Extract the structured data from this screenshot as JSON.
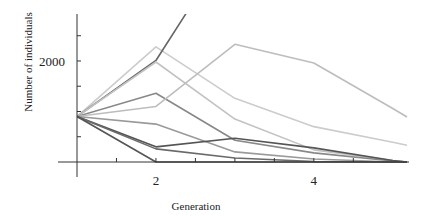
{
  "chart_data": {
    "type": "line",
    "title": "",
    "xlabel": "Generation",
    "ylabel": "Number of individuals",
    "x_ticks": [
      1.5,
      2,
      2.5,
      3,
      3.5,
      4,
      4.5
    ],
    "x_tick_labels": [
      {
        "value": 2,
        "label": "2"
      },
      {
        "value": 4,
        "label": "4"
      }
    ],
    "y_ticks": [
      500,
      1000,
      1500,
      2000,
      2500
    ],
    "y_tick_labels": [
      {
        "value": 2000,
        "label": "2000"
      }
    ],
    "xlim": [
      1,
      5.18
    ],
    "ylim": [
      0,
      2930
    ],
    "grid": false,
    "legend": "none",
    "series": [
      {
        "name": "run-1",
        "color": "#cccccc",
        "x": [
          1,
          2,
          3,
          4,
          5,
          5.18
        ],
        "values": [
          900,
          2280,
          1260,
          700,
          390,
          330
        ]
      },
      {
        "name": "run-2",
        "color": "#666666",
        "x": [
          1,
          2,
          3
        ],
        "values": [
          900,
          2010,
          4450
        ]
      },
      {
        "name": "run-3",
        "color": "#c2c2c2",
        "x": [
          1,
          2,
          3,
          4,
          5,
          5.18
        ],
        "values": [
          900,
          1980,
          850,
          240,
          30,
          0
        ]
      },
      {
        "name": "run-4",
        "color": "#888888",
        "x": [
          1,
          2,
          3,
          4,
          5,
          5.18
        ],
        "values": [
          900,
          1360,
          430,
          180,
          20,
          0
        ]
      },
      {
        "name": "run-5",
        "color": "#bdbdbd",
        "x": [
          1,
          2,
          3,
          4,
          5,
          5.18
        ],
        "values": [
          900,
          1100,
          2330,
          1960,
          1060,
          890
        ]
      },
      {
        "name": "run-6",
        "color": "#9a9a9a",
        "x": [
          1,
          2,
          3,
          4,
          5,
          5.18
        ],
        "values": [
          900,
          750,
          200,
          60,
          0,
          0
        ]
      },
      {
        "name": "run-7",
        "color": "#555555",
        "x": [
          1,
          2,
          3,
          4,
          5,
          5.18
        ],
        "values": [
          900,
          300,
          470,
          280,
          30,
          0
        ]
      },
      {
        "name": "run-8",
        "color": "#6a6a6a",
        "x": [
          1,
          2,
          3,
          4,
          5,
          5.18
        ],
        "values": [
          900,
          260,
          80,
          10,
          0,
          0
        ]
      },
      {
        "name": "run-9",
        "color": "#555555",
        "x": [
          1,
          2,
          3,
          4,
          5,
          5.18
        ],
        "values": [
          900,
          0,
          0,
          0,
          0,
          0
        ]
      }
    ]
  }
}
